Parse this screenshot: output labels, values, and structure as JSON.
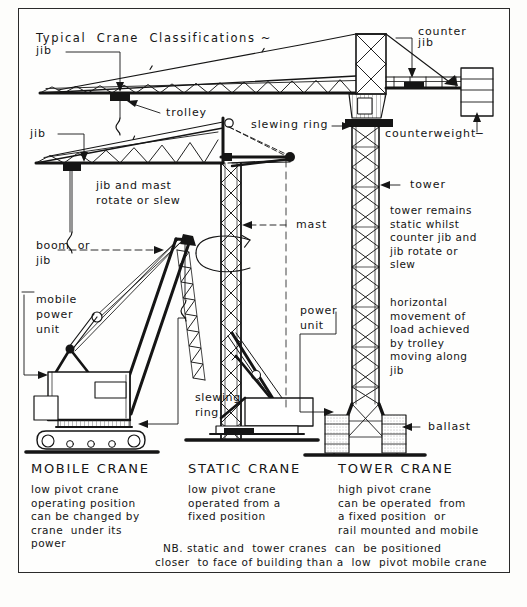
{
  "document": {
    "title": "Typical  Crane  Classifications ~",
    "kind": "technical-drawing"
  },
  "colors": {
    "ink": "#151515",
    "paper": "#fefefd",
    "page": "#fdfdfb",
    "frame": "#2a2a2a"
  },
  "callouts": {
    "jib_top": "jib",
    "trolley": "trolley",
    "counter_jib": "counter\njib",
    "counterweight": "counterweight─",
    "slewing_ring_top": "slewing ring",
    "jib_mid": "jib",
    "jib_mast_rotate": "jib and mast\nrotate or slew",
    "boom_or_jib": "boom  or\njib",
    "mobile_power_unit": "mobile\npower\nunit",
    "slewing_ring_mobile": "slewing\nring",
    "mast": "mast",
    "power_unit": "power\nunit",
    "tower": "tower",
    "tower_remains": "tower remains\nstatic whilst\ncounter jib and\njib rotate or\nslew",
    "horizontal_movement": "horizontal\nmovement of\nload achieved\nby trolley\nmoving along\njib",
    "ballast": "ballast"
  },
  "columns": [
    {
      "id": "mobile",
      "heading": "MOBILE CRANE",
      "description": "low pivot crane\noperating position\ncan be changed by\ncrane  under its\npower"
    },
    {
      "id": "static",
      "heading": "STATIC CRANE",
      "description": "low pivot crane\noperated from a\nfixed position"
    },
    {
      "id": "tower",
      "heading": "TOWER CRANE",
      "description": "high pivot crane\ncan be operated  from\na fixed position  or\nrail mounted and mobile"
    }
  ],
  "footnote": {
    "line1": "NB. static and  tower cranes  can  be positioned",
    "line2": "closer  to face of building than a  low  pivot mobile crane"
  }
}
